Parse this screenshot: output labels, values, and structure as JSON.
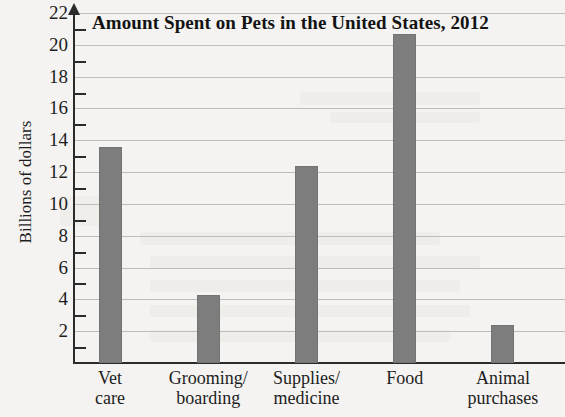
{
  "chart_data": {
    "type": "bar",
    "title": "Amount Spent on Pets in the United States, 2012",
    "xlabel": "",
    "ylabel": "Billions of dollars",
    "categories": [
      "Vet\ncare",
      "Grooming/\nboarding",
      "Supplies/\nmedicine",
      "Food",
      "Animal\npurchases"
    ],
    "values": [
      13.6,
      4.3,
      12.4,
      20.7,
      2.4
    ],
    "ylim": [
      0,
      22
    ],
    "ytick_labels": [
      "22",
      "20",
      "18",
      "16",
      "14",
      "12",
      "10",
      "8",
      "6",
      "4",
      "2"
    ],
    "ytick_values": [
      22,
      20,
      18,
      16,
      14,
      12,
      10,
      8,
      6,
      4,
      2
    ],
    "yminor_ticks": [
      21,
      19,
      17,
      15,
      13,
      11,
      9,
      7,
      5,
      3,
      1
    ],
    "grid": true,
    "legend": "none",
    "bar_color": "#7d7d7d",
    "axis_color": "#2b2b2b",
    "grid_color": "#bfbdbb",
    "background_color": "#f4f3f1"
  }
}
